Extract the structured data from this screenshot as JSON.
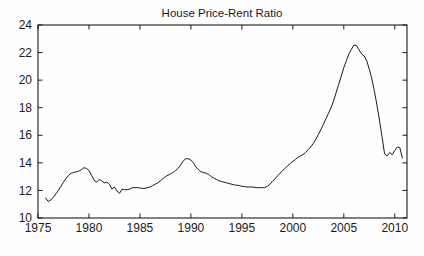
{
  "chart_data": {
    "type": "line",
    "title": "House Price-Rent Ratio",
    "xlabel": "",
    "ylabel": "",
    "xlim": [
      1975,
      2011.2
    ],
    "ylim": [
      10,
      24
    ],
    "xticks": [
      1975,
      1980,
      1985,
      1990,
      1995,
      2000,
      2005,
      2010
    ],
    "xticklabels": [
      "1975",
      "1980",
      "1985",
      "1990",
      "1995",
      "2000",
      "2005",
      "2010"
    ],
    "yticks": [
      10,
      12,
      14,
      16,
      18,
      20,
      22,
      24
    ],
    "yticklabels": [
      "10",
      "12",
      "14",
      "16",
      "18",
      "20",
      "22",
      "24"
    ],
    "grid": false,
    "legend": null,
    "line_color": "#1a1a1a",
    "line_width": 1.0,
    "series": [
      {
        "name": "House Price-Rent Ratio",
        "x": [
          1975.75,
          1976.0,
          1976.25,
          1976.5,
          1976.75,
          1977.0,
          1977.25,
          1977.5,
          1977.75,
          1978.0,
          1978.25,
          1978.5,
          1978.75,
          1979.0,
          1979.25,
          1979.5,
          1979.75,
          1980.0,
          1980.25,
          1980.5,
          1980.75,
          1981.0,
          1981.25,
          1981.5,
          1981.75,
          1982.0,
          1982.25,
          1982.5,
          1982.75,
          1983.0,
          1983.25,
          1983.5,
          1983.75,
          1984.0,
          1984.25,
          1984.5,
          1984.75,
          1985.0,
          1985.25,
          1985.5,
          1985.75,
          1986.0,
          1986.25,
          1986.5,
          1986.75,
          1987.0,
          1987.25,
          1987.5,
          1987.75,
          1988.0,
          1988.25,
          1988.5,
          1988.75,
          1989.0,
          1989.25,
          1989.5,
          1989.75,
          1990.0,
          1990.25,
          1990.5,
          1990.75,
          1991.0,
          1991.25,
          1991.5,
          1991.75,
          1992.0,
          1992.25,
          1992.5,
          1992.75,
          1993.0,
          1993.25,
          1993.5,
          1993.75,
          1994.0,
          1994.25,
          1994.5,
          1994.75,
          1995.0,
          1995.25,
          1995.5,
          1995.75,
          1996.0,
          1996.25,
          1996.5,
          1996.75,
          1997.0,
          1997.25,
          1997.5,
          1997.75,
          1998.0,
          1998.25,
          1998.5,
          1998.75,
          1999.0,
          1999.25,
          1999.5,
          1999.75,
          2000.0,
          2000.25,
          2000.5,
          2000.75,
          2001.0,
          2001.25,
          2001.5,
          2001.75,
          2002.0,
          2002.25,
          2002.5,
          2002.75,
          2003.0,
          2003.25,
          2003.5,
          2003.75,
          2004.0,
          2004.25,
          2004.5,
          2004.75,
          2005.0,
          2005.25,
          2005.5,
          2005.75,
          2006.0,
          2006.25,
          2006.5,
          2006.75,
          2007.0,
          2007.25,
          2007.5,
          2007.75,
          2008.0,
          2008.25,
          2008.5,
          2008.75,
          2009.0,
          2009.25,
          2009.5,
          2009.75,
          2010.0,
          2010.25,
          2010.5,
          2010.75
        ],
        "y": [
          11.45,
          11.2,
          11.3,
          11.5,
          11.75,
          12.0,
          12.3,
          12.6,
          12.85,
          13.1,
          13.25,
          13.3,
          13.35,
          13.4,
          13.5,
          13.65,
          13.6,
          13.45,
          13.1,
          12.75,
          12.6,
          12.8,
          12.7,
          12.55,
          12.6,
          12.45,
          12.1,
          12.25,
          11.95,
          11.8,
          12.1,
          12.05,
          12.05,
          12.1,
          12.2,
          12.2,
          12.2,
          12.18,
          12.15,
          12.15,
          12.2,
          12.25,
          12.35,
          12.45,
          12.55,
          12.7,
          12.85,
          13.0,
          13.1,
          13.2,
          13.3,
          13.45,
          13.6,
          13.85,
          14.15,
          14.3,
          14.3,
          14.2,
          14.0,
          13.7,
          13.5,
          13.35,
          13.3,
          13.25,
          13.15,
          13.0,
          12.9,
          12.8,
          12.7,
          12.65,
          12.6,
          12.55,
          12.5,
          12.45,
          12.4,
          12.38,
          12.35,
          12.3,
          12.28,
          12.25,
          12.25,
          12.25,
          12.22,
          12.2,
          12.2,
          12.2,
          12.2,
          12.3,
          12.45,
          12.65,
          12.85,
          13.05,
          13.25,
          13.45,
          13.6,
          13.8,
          13.95,
          14.1,
          14.25,
          14.4,
          14.5,
          14.6,
          14.75,
          14.95,
          15.15,
          15.4,
          15.7,
          16.05,
          16.4,
          16.8,
          17.2,
          17.6,
          18.0,
          18.5,
          19.1,
          19.7,
          20.3,
          20.9,
          21.4,
          21.9,
          22.25,
          22.55,
          22.5,
          22.2,
          21.9,
          21.75,
          21.4,
          20.8,
          20.1,
          19.2,
          18.2,
          17.1,
          15.9,
          14.65,
          14.5,
          14.75,
          14.6,
          14.9,
          15.15,
          15.1,
          14.35
        ]
      }
    ]
  }
}
